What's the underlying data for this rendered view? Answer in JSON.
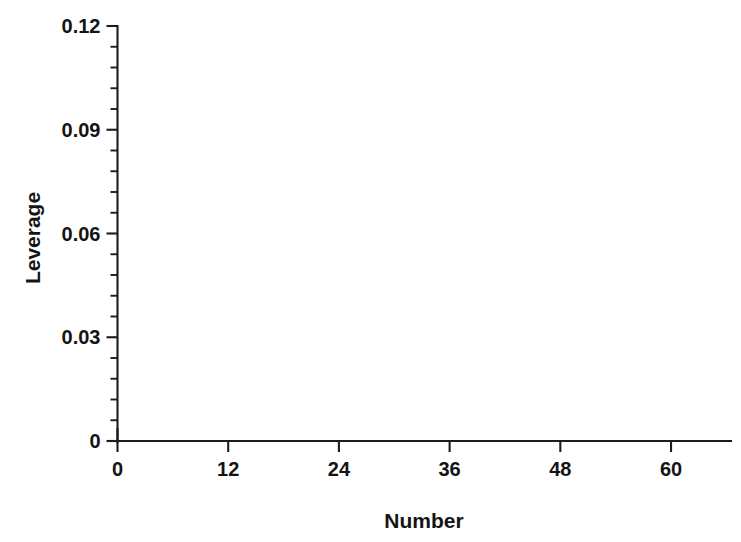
{
  "chart_data": {
    "type": "scatter",
    "title": "",
    "xlabel": "Number",
    "ylabel": "Leverage",
    "xlim": [
      0,
      66.5
    ],
    "ylim": [
      0,
      0.12
    ],
    "grid": false,
    "legend": "none",
    "marker": "asterisk",
    "marker_color": "#161616",
    "xticks": [
      0,
      12,
      24,
      36,
      48,
      60
    ],
    "xtick_labels": [
      "0",
      "12",
      "24",
      "36",
      "48",
      "60"
    ],
    "x_minor_tick_interval": 4,
    "yticks": [
      0,
      0.03,
      0.06,
      0.09,
      0.12
    ],
    "ytick_labels": [
      "0",
      "0.03",
      "0.06",
      "0.09",
      "0.12"
    ],
    "y_minor_tick_interval": 0.006,
    "x": [
      1,
      2,
      3,
      4,
      5,
      6,
      7,
      8,
      9,
      10,
      11,
      12,
      13,
      14,
      15,
      16,
      17,
      18,
      19,
      20,
      21,
      22,
      23,
      24,
      25,
      26,
      27,
      28,
      29,
      30,
      31,
      32,
      33,
      34,
      35,
      36,
      37,
      38,
      39,
      40,
      41,
      42,
      43,
      44,
      45,
      46,
      47,
      48,
      49,
      50,
      51,
      52,
      53,
      54,
      55,
      56,
      57,
      58,
      59,
      60,
      61,
      62,
      63,
      64,
      65
    ],
    "y": [
      0.054,
      0.065,
      0.049,
      0.101,
      0.049,
      0.018,
      0.018,
      0.114,
      0.036,
      0.018,
      0.018,
      0.033,
      0.024,
      0.023,
      0.018,
      0.036,
      0.018,
      0.099,
      0.061,
      0.065,
      0.018,
      0.024,
      0.024,
      0.018,
      0.031,
      0.03,
      0.018,
      0.036,
      0.018,
      0.03,
      0.018,
      0.018,
      0.018,
      0.018,
      0.018,
      0.018,
      0.018,
      0.018,
      0.024,
      0.018,
      0.018,
      0.018,
      0.018,
      0.018,
      0.018,
      0.018,
      0.018,
      0.036,
      0.055,
      0.077,
      0.03,
      0.018,
      0.023,
      0.023,
      0.018,
      0.023,
      0.018,
      0.023,
      0.018,
      0.018,
      0.035,
      0.018,
      0.023,
      0.042,
      0.065
    ],
    "series_name": "Leverage",
    "n_points": 65
  },
  "axes": {
    "y_axis_title": "Leverage",
    "x_axis_title": "Number"
  }
}
